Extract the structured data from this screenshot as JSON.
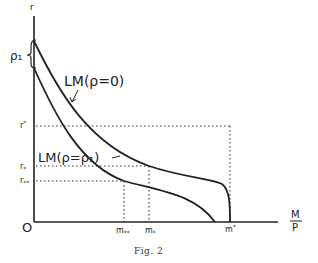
{
  "diagram": {
    "caption": "Fig. 2",
    "axes": {
      "y_label": "r",
      "x_label_num": "M",
      "x_label_den": "P",
      "origin": "O"
    },
    "curves": [
      {
        "id": "lm-rho-0",
        "label": "LM(ρ=0)"
      },
      {
        "id": "lm-rho-rho1",
        "label": "LM(ρ=ρ₁)"
      }
    ],
    "gap_label": "ρ₁",
    "y_ticks": [
      {
        "id": "r-star-sup",
        "label": "r*"
      },
      {
        "id": "r-star-sub",
        "label": "r*"
      },
      {
        "id": "r-double-star-sub",
        "label": "r**"
      }
    ],
    "x_ticks": [
      {
        "id": "m-double-star-sub",
        "label": "m**"
      },
      {
        "id": "m-star-sub",
        "label": "m*"
      },
      {
        "id": "m-star-sup",
        "label": "m*"
      }
    ],
    "colors": {
      "ink": "#222222",
      "background": "#ffffff"
    }
  }
}
